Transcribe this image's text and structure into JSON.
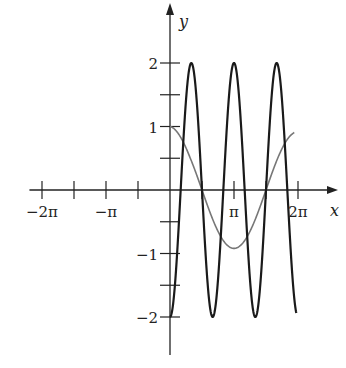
{
  "chart_data": {
    "type": "line",
    "title": "",
    "xlabel": "x",
    "ylabel": "y",
    "xlim": [
      -6.9,
      7.0
    ],
    "ylim": [
      -2.6,
      2.7
    ],
    "grid": false,
    "legend": null,
    "x_ticks": [
      {
        "value": -6.2832,
        "label": "−2π"
      },
      {
        "value": -4.7124,
        "label": ""
      },
      {
        "value": -3.1416,
        "label": "−π"
      },
      {
        "value": -1.5708,
        "label": ""
      },
      {
        "value": 1.5708,
        "label": ""
      },
      {
        "value": 3.1416,
        "label": "π"
      },
      {
        "value": 4.7124,
        "label": ""
      },
      {
        "value": 6.2832,
        "label": "2π"
      }
    ],
    "y_ticks": [
      {
        "value": 2,
        "label": "2"
      },
      {
        "value": 1.5,
        "label": ""
      },
      {
        "value": 1,
        "label": "1"
      },
      {
        "value": 0.5,
        "label": ""
      },
      {
        "value": -0.5,
        "label": ""
      },
      {
        "value": -1,
        "label": "−1"
      },
      {
        "value": -1.5,
        "label": ""
      },
      {
        "value": -2,
        "label": "−2"
      }
    ],
    "series": [
      {
        "name": "y = cos x",
        "color": "#777777",
        "domain": [
          0,
          6.1
        ],
        "x": [
          0,
          0.785,
          1.571,
          2.356,
          3.142,
          3.927,
          4.712,
          5.498,
          6.1
        ],
        "y": [
          1,
          0.707,
          0,
          -0.707,
          -0.92,
          -0.707,
          0,
          0.707,
          0.92
        ]
      },
      {
        "name": "y = -2 cos 3x",
        "color": "#1a1a1a",
        "domain": [
          0,
          6.2
        ],
        "x": [
          0,
          0.524,
          1.047,
          1.571,
          2.094,
          2.618,
          3.142,
          3.665,
          4.189,
          4.712,
          5.236,
          5.76,
          6.2
        ],
        "y": [
          -2,
          0,
          2,
          0,
          -2,
          0,
          2,
          0,
          -2,
          0,
          2,
          0,
          -1.9
        ]
      }
    ]
  }
}
